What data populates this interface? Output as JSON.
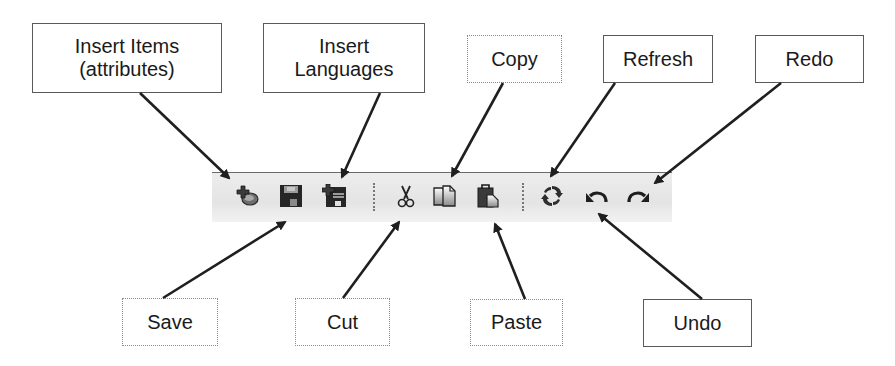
{
  "callouts_top": [
    {
      "id": "insert-items",
      "lines": [
        "Insert Items",
        "(attributes)"
      ]
    },
    {
      "id": "insert-languages",
      "lines": [
        "Insert",
        "Languages"
      ]
    },
    {
      "id": "copy",
      "lines": [
        "Copy"
      ]
    },
    {
      "id": "refresh",
      "lines": [
        "Refresh"
      ]
    },
    {
      "id": "redo",
      "lines": [
        "Redo"
      ]
    }
  ],
  "callouts_bottom": [
    {
      "id": "save",
      "lines": [
        "Save"
      ]
    },
    {
      "id": "cut",
      "lines": [
        "Cut"
      ]
    },
    {
      "id": "paste",
      "lines": [
        "Paste"
      ]
    },
    {
      "id": "undo",
      "lines": [
        "Undo"
      ]
    }
  ],
  "toolbar": {
    "buttons": [
      {
        "name": "insert-items",
        "icon": "insert-item-icon",
        "tooltip": "Insert Items (attributes)"
      },
      {
        "name": "save",
        "icon": "save-icon",
        "tooltip": "Save"
      },
      {
        "name": "insert-languages",
        "icon": "insert-language-icon",
        "tooltip": "Insert Languages"
      },
      {
        "name": "cut",
        "icon": "scissors-icon",
        "tooltip": "Cut"
      },
      {
        "name": "copy",
        "icon": "copy-icon",
        "tooltip": "Copy"
      },
      {
        "name": "paste",
        "icon": "paste-icon",
        "tooltip": "Paste"
      },
      {
        "name": "refresh",
        "icon": "refresh-icon",
        "tooltip": "Refresh"
      },
      {
        "name": "undo",
        "icon": "undo-icon",
        "tooltip": "Undo"
      },
      {
        "name": "redo",
        "icon": "redo-icon",
        "tooltip": "Redo"
      }
    ]
  },
  "colors": {
    "toolbar_bg": "#e8e8e8",
    "icon_dark": "#2b2b2b",
    "icon_mid": "#7a7a7a",
    "arrow": "#1f1f1f",
    "box_border": "#5a5a5a"
  }
}
